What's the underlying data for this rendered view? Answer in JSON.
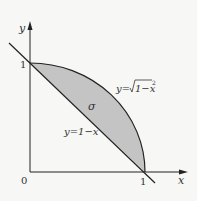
{
  "diagram": {
    "title": "",
    "axes": {
      "x_label": "x",
      "y_label": "y",
      "origin_label": "0",
      "x_tick_label": "1",
      "y_tick_label": "1"
    },
    "curves": [
      {
        "name": "quarter-circle",
        "label": "y=√(1−x²)",
        "label_prefix": "y=",
        "label_radicand": "1−x",
        "label_exp": "2"
      },
      {
        "name": "line",
        "label": "y=1−x"
      }
    ],
    "region": {
      "label": "σ",
      "fill": "#c4c4c4"
    },
    "colors": {
      "stroke": "#222222",
      "background": "#f7f7f5",
      "text": "#333333"
    }
  }
}
